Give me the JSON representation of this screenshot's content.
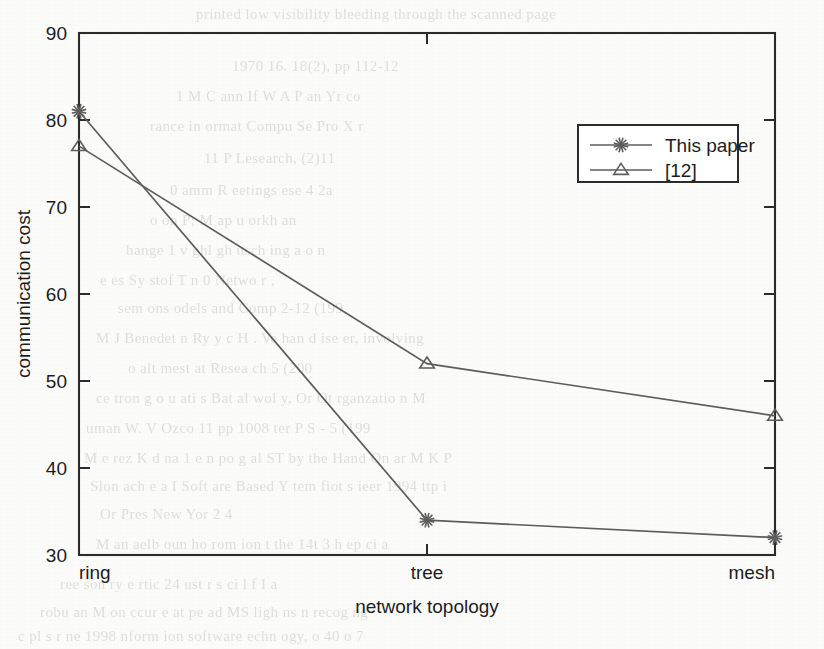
{
  "figure": {
    "kind": "scanned-line-plot"
  },
  "chart_data": {
    "type": "line",
    "title": "",
    "xlabel": "network topology",
    "ylabel": "communication cost",
    "categories": [
      "ring",
      "tree",
      "mesh"
    ],
    "ylim": [
      30,
      90
    ],
    "yticks": [
      30,
      40,
      50,
      60,
      70,
      80,
      90
    ],
    "ytick_labels": [
      "30",
      "40",
      "50",
      "60",
      "70",
      "80",
      "90"
    ],
    "xtick_labels": [
      "ring",
      "tree",
      "mesh"
    ],
    "grid": false,
    "legend_position": "upper right",
    "series": [
      {
        "name": "This paper",
        "marker": "star",
        "color": "#5d5d5d",
        "values": [
          81,
          34,
          32
        ]
      },
      {
        "name": "[12]",
        "marker": "triangle-up",
        "color": "#5d5d5d",
        "values": [
          77,
          52,
          46
        ]
      }
    ]
  },
  "legend": {
    "entries": [
      {
        "label": "This paper",
        "marker": "star-marker"
      },
      {
        "label": "[12]",
        "marker": "triangle-marker"
      }
    ]
  },
  "background_text": {
    "note": "faint bleed-through text from reverse side of scanned page",
    "lines": [
      "printed low visibility bleeding through the scanned page",
      "1970 16. 18(2), pp 112-12",
      "1 M  C  ann  If W A  P    an  Yr co",
      "rance  in   ormat  Compu  Se      Pro     X    r",
      "11 P  Lesearch,  (2)11",
      "0      amm  R  eetings  ese   4 2a",
      "o  on  P;  M  ap   u  orkh   an",
      "hange 1  v  ghl  gh  usch  ing a    o n",
      "e  es  Sy stof T  n    0  Netwo r    ,",
      "sem   ons   odels  and  Comp   2-12 (199",
      "M  J  Benedet  n  Ry  y  c  H  .  Ve   han d ise   er, involving",
      "o          alt   mest   at    Resea  ch    5    (200",
      "ce  tron  g  o   u     ati    s Bat   al  wol  y,   Or  Ot  rganzatio  n  M",
      "uman   W.  V  Ozco  11    pp     1008       ter    P    S   -  5  (199",
      "M  e  rez  K  d  na  1   e  n  po  g  al  ST by  the  Hand   On   ar  M   K  P",
      "Slon   ach  e   a  I     Soft  are  Based  Y  tem  fiot  s  ieer  1994  ttp  i",
      "Or  Pres    New  Yor   2   4",
      "M  an   aelb    oun  ho  rom  ion  t  the  14t   3 h  ep  ci  a",
      "ree  son  ry  e  rtic  24   ust  r  s  ci   l  f   I a",
      "robu   an   M  on   ccur   e   at  pe  ad   MS   ligh  ns  n  recog  ng",
      "c  pl   s   r  ne     1998  nform  ion  software  echn   ogy,   o   40    o  7"
    ]
  }
}
